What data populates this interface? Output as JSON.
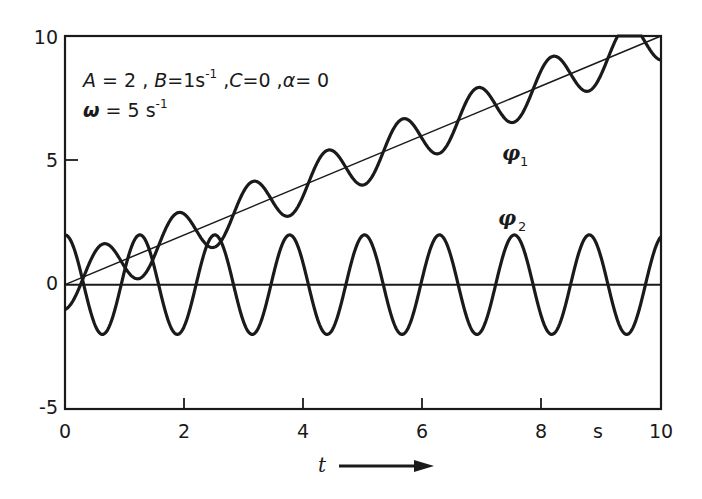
{
  "chart_data": {
    "type": "line",
    "title": "",
    "xlabel": "t",
    "xunit": "s",
    "ylabel": "",
    "xlim": [
      0,
      10
    ],
    "ylim": [
      -5,
      10
    ],
    "xticks": [
      0,
      2,
      4,
      6,
      8,
      10
    ],
    "xtick_labels": [
      "0",
      "2",
      "4",
      "6",
      "8",
      "10"
    ],
    "yticks": [
      -5,
      0,
      5,
      10
    ],
    "ytick_labels": [
      "-5",
      "0",
      "5",
      "10"
    ],
    "grid": false,
    "parameters_text": {
      "line1": [
        "A = 2",
        "B = 1 s⁻¹",
        "C = 0",
        "α = 0"
      ],
      "line2": "ω = 5 s⁻¹"
    },
    "series": [
      {
        "name": "φ1",
        "formula": "t - cos(5t)",
        "x": [
          0,
          0.63,
          1.26,
          1.88,
          2.51,
          3.14,
          3.77,
          4.4,
          5.03,
          5.65,
          6.28,
          6.91,
          7.54,
          8.17,
          8.8,
          9.42,
          10
        ],
        "values": [
          -1,
          1.63,
          0.26,
          2.88,
          1.51,
          4.14,
          2.77,
          5.4,
          4.03,
          6.65,
          5.28,
          7.91,
          6.54,
          9.17,
          7.8,
          10.42,
          9.03
        ]
      },
      {
        "name": "φ2",
        "formula": "2 cos(5t)",
        "x": [
          0,
          0.63,
          1.26,
          1.88,
          2.51,
          3.14,
          3.77,
          4.4,
          5.03,
          5.65,
          6.28,
          6.91,
          7.54,
          8.17,
          8.8,
          9.42,
          10
        ],
        "values": [
          2,
          -2,
          2,
          -2,
          2,
          -2,
          2,
          -2,
          2,
          -2,
          2,
          -2,
          2,
          -2,
          2,
          -2,
          1.93
        ]
      },
      {
        "name": "trend line (B t)",
        "x": [
          0,
          10
        ],
        "values": [
          0,
          10
        ]
      },
      {
        "name": "zero line",
        "x": [
          0,
          10
        ],
        "values": [
          0,
          0
        ]
      }
    ],
    "labels": {
      "phi1": {
        "main": "φ",
        "sub": "1",
        "x": 8.1,
        "y": 4.9
      },
      "phi2": {
        "main": "φ",
        "sub": "2",
        "x": 7.4,
        "y": 2.3
      }
    },
    "omega": 5,
    "A": 2
  },
  "axis": {
    "x_label": "t",
    "x_unit": "s"
  },
  "text": {
    "params_A": "A",
    "params_A_val": " = 2 ,  ",
    "params_B": "B",
    "params_B_val": "=1s",
    "params_B_sup": "-1",
    "params_C_sep": " ,",
    "params_C": "C",
    "params_C_val": "=0 ,",
    "params_alpha": "α",
    "params_alpha_val": "= 0",
    "params_omega": "ω",
    "params_omega_val": " = 5 s",
    "params_omega_sup": "-1",
    "phi": "φ",
    "phi1_sub": "1",
    "phi2_sub": "2"
  }
}
